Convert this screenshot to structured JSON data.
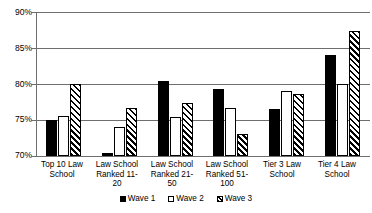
{
  "chart_data": {
    "type": "bar",
    "title": "",
    "xlabel": "",
    "ylabel": "",
    "ylim": [
      70,
      90
    ],
    "ytick_values": [
      90,
      85,
      80,
      75,
      70
    ],
    "ytick_labels": [
      "90%",
      "85%",
      "80%",
      "75%",
      "70%"
    ],
    "grid": true,
    "legend_position": "bottom",
    "categories": [
      "Top 10 Law School",
      "Law School Ranked 11-20",
      "Law School Ranked 21-50",
      "Law School Ranked 51-100",
      "Tier 3 Law School",
      "Tier 4 Law School"
    ],
    "category_lines": [
      [
        "Top 10 Law",
        "School"
      ],
      [
        "Law School",
        "Ranked 11-",
        "20"
      ],
      [
        "Law School",
        "Ranked 21-",
        "50"
      ],
      [
        "Law School",
        "Ranked 51-",
        "100"
      ],
      [
        "Tier 3 Law",
        "School"
      ],
      [
        "Tier 4 Law",
        "School"
      ]
    ],
    "series": [
      {
        "name": "Wave 1",
        "fill": "solid-black",
        "values": [
          75.0,
          70.4,
          80.4,
          79.3,
          76.5,
          84.0
        ]
      },
      {
        "name": "Wave 2",
        "fill": "white-outline",
        "values": [
          75.5,
          74.0,
          75.4,
          76.7,
          79.0,
          80.0
        ]
      },
      {
        "name": "Wave 3",
        "fill": "diagonal-hatch",
        "values": [
          80.0,
          76.6,
          77.4,
          73.0,
          78.6,
          87.3
        ]
      }
    ]
  },
  "legend": {
    "items": [
      {
        "label": "Wave 1"
      },
      {
        "label": "Wave 2"
      },
      {
        "label": "Wave 3"
      }
    ]
  },
  "colors": {
    "series_1": "#000000",
    "series_2": "#ffffff",
    "series_3": "#000000",
    "gridline": "#6e6e6e",
    "background": "#ffffff",
    "text": "#000000"
  }
}
